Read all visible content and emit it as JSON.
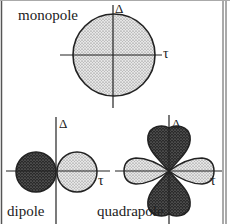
{
  "figure": {
    "panels": [
      {
        "name": "monopole",
        "label": "monopole",
        "x_axis_label": "τ",
        "y_axis_label": "Δ"
      },
      {
        "name": "dipole",
        "label": "dipole",
        "x_axis_label": "τ",
        "y_axis_label": "Δ"
      },
      {
        "name": "quadrapole",
        "label": "quadrapole",
        "x_axis_label": "τ",
        "y_axis_label": "Δ"
      }
    ]
  },
  "colors": {
    "light_fill": "#c8c8c8",
    "dark_fill": "#333333",
    "line": "#222222",
    "border": "#555555"
  }
}
